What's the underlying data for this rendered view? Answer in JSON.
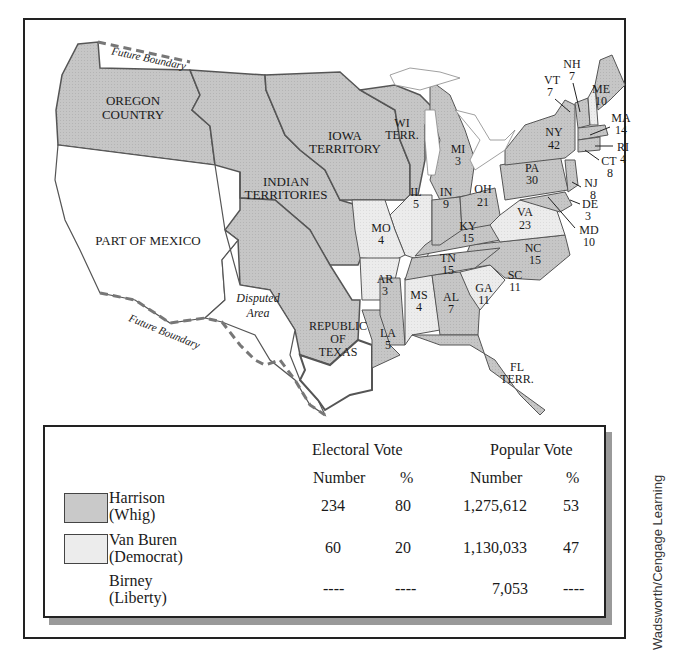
{
  "map": {
    "title_hidden": "",
    "colors": {
      "whig": "#c9c9c9",
      "democrat": "#ececec",
      "non_state": "#cfcfcf",
      "border": "#555555",
      "mexico": "#ffffff"
    },
    "regions": {
      "oregon": "OREGON\nCOUNTRY",
      "oregon_l1": "OREGON",
      "oregon_l2": "COUNTRY",
      "iowa_l1": "IOWA",
      "iowa_l2": "TERRITORY",
      "indian_l1": "INDIAN",
      "indian_l2": "TERRITORIES",
      "wi_l1": "WI",
      "wi_l2": "TERR.",
      "mexico": "PART OF MEXICO",
      "disputed_l1": "Disputed",
      "disputed_l2": "Area",
      "texas_l1": "REPUBLIC",
      "texas_l2": "OF",
      "texas_l3": "TEXAS",
      "fl_l1": "FL",
      "fl_l2": "TERR.",
      "future_boundary_north": "Future Boundary",
      "future_boundary_south": "Future Boundary"
    },
    "states": [
      {
        "abbr": "ME",
        "votes": "10",
        "party": "whig"
      },
      {
        "abbr": "NH",
        "votes": "7",
        "party": "democrat"
      },
      {
        "abbr": "VT",
        "votes": "7",
        "party": "whig"
      },
      {
        "abbr": "MA",
        "votes": "14",
        "party": "whig"
      },
      {
        "abbr": "RI",
        "votes": "4",
        "party": "whig"
      },
      {
        "abbr": "CT",
        "votes": "8",
        "party": "whig"
      },
      {
        "abbr": "NY",
        "votes": "42",
        "party": "whig"
      },
      {
        "abbr": "NJ",
        "votes": "8",
        "party": "whig"
      },
      {
        "abbr": "PA",
        "votes": "30",
        "party": "whig"
      },
      {
        "abbr": "DE",
        "votes": "3",
        "party": "whig"
      },
      {
        "abbr": "MD",
        "votes": "10",
        "party": "whig"
      },
      {
        "abbr": "VA",
        "votes": "23",
        "party": "democrat"
      },
      {
        "abbr": "NC",
        "votes": "15",
        "party": "whig"
      },
      {
        "abbr": "SC",
        "votes": "11",
        "party": "democrat"
      },
      {
        "abbr": "GA",
        "votes": "11",
        "party": "whig"
      },
      {
        "abbr": "AL",
        "votes": "7",
        "party": "democrat"
      },
      {
        "abbr": "MS",
        "votes": "4",
        "party": "whig"
      },
      {
        "abbr": "LA",
        "votes": "5",
        "party": "whig"
      },
      {
        "abbr": "TN",
        "votes": "15",
        "party": "whig"
      },
      {
        "abbr": "KY",
        "votes": "15",
        "party": "whig"
      },
      {
        "abbr": "OH",
        "votes": "21",
        "party": "whig"
      },
      {
        "abbr": "IN",
        "votes": "9",
        "party": "whig"
      },
      {
        "abbr": "IL",
        "votes": "5",
        "party": "democrat"
      },
      {
        "abbr": "MI",
        "votes": "3",
        "party": "whig"
      },
      {
        "abbr": "MO",
        "votes": "4",
        "party": "democrat"
      },
      {
        "abbr": "AR",
        "votes": "3",
        "party": "democrat"
      }
    ]
  },
  "legend": {
    "electoral_header": "Electoral Vote",
    "popular_header": "Popular Vote",
    "sub_number": "Number",
    "sub_percent": "%",
    "rows": [
      {
        "name": "Harrison",
        "party": "(Whig)",
        "ev_number": "234",
        "ev_percent": "80",
        "pv_number": "1,275,612",
        "pv_percent": "53",
        "swatch": "#c9c9c9"
      },
      {
        "name": "Van Buren",
        "party": "(Democrat)",
        "ev_number": "60",
        "ev_percent": "20",
        "pv_number": "1,130,033",
        "pv_percent": "47",
        "swatch": "#ececec"
      },
      {
        "name": "Birney",
        "party": "(Liberty)",
        "ev_number": "----",
        "ev_percent": "----",
        "pv_number": "7,053",
        "pv_percent": "----",
        "swatch": ""
      }
    ]
  },
  "credit": "Wadsworth/Cengage Learning"
}
